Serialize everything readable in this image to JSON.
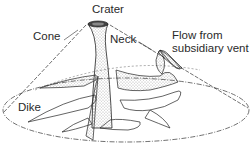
{
  "diagram": {
    "labels": {
      "crater": "Crater",
      "cone": "Cone",
      "neck": "Neck",
      "flow_line1": "Flow from",
      "flow_line2": "subsidiary vent",
      "dike": "Dike"
    },
    "colors": {
      "ink": "#2a2a2a",
      "stipple": "#555555",
      "background": "#ffffff"
    }
  }
}
